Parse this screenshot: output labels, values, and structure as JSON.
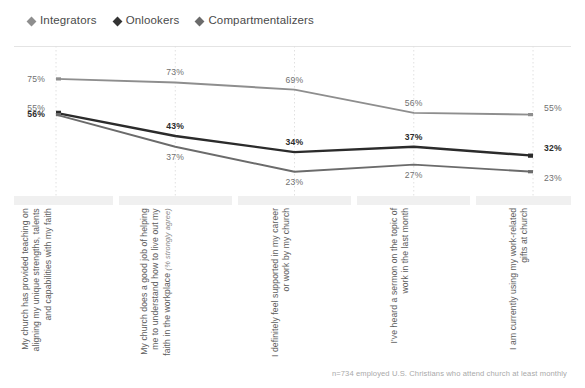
{
  "legend": {
    "items": [
      {
        "label": "Integrators",
        "marker": "diamond-marker",
        "color": "#8e8e8e"
      },
      {
        "label": "Onlookers",
        "marker": "diamond-marker",
        "color": "#333333"
      },
      {
        "label": "Compartmentalizers",
        "marker": "diamond-marker",
        "color": "#6b6b6b"
      }
    ]
  },
  "footnote": "n=734 employed U.S. Christians who attend church at least monthly",
  "chart_data": {
    "type": "line",
    "title": "",
    "subtitle": "",
    "xlabel": "",
    "ylabel": "",
    "ylim": [
      15,
      80
    ],
    "grid": "vertical-dotted",
    "legend_position": "top-left",
    "value_suffix": "%",
    "categories": [
      "My church has provided teaching on aligning my unique strengths, talents and capabilities with my faith",
      "My church does a good job of helping me to understand how to live out my faith in the workplace (% strongly agree)",
      "I definitely feel supported in my career or work by my church",
      "I've heard a sermon on the topic of work in the last month",
      "I am currently using my work-related gifts at church"
    ],
    "category_notes": [
      "",
      "(% strongly agree)",
      "",
      "",
      ""
    ],
    "series": [
      {
        "name": "Integrators",
        "color": "#8e8e8e",
        "values": [
          75,
          73,
          69,
          56,
          55
        ],
        "labels": [
          "75%",
          "73%",
          "69%",
          "56%",
          "55%"
        ]
      },
      {
        "name": "Onlookers",
        "color": "#2b2b2b",
        "values": [
          56,
          43,
          34,
          37,
          32
        ],
        "labels": [
          "56%",
          "43%",
          "34%",
          "37%",
          "32%"
        ]
      },
      {
        "name": "Compartmentalizers",
        "color": "#6b6b6b",
        "values": [
          55,
          37,
          23,
          27,
          23
        ],
        "labels": [
          "55%",
          "37%",
          "23%",
          "27%",
          "23%"
        ]
      }
    ]
  }
}
